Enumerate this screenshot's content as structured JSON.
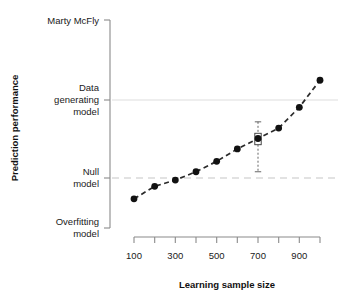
{
  "chart_data": {
    "type": "line",
    "title": "",
    "xlabel": "Learning sample size",
    "ylabel": "Prediction performance",
    "x": [
      100,
      200,
      300,
      400,
      500,
      600,
      700,
      800,
      900,
      1000
    ],
    "values": [
      0.14,
      0.2,
      0.23,
      0.27,
      0.32,
      0.38,
      0.43,
      0.48,
      0.58,
      0.71
    ],
    "xlim": [
      100,
      1000
    ],
    "ylim": [
      0,
      1
    ],
    "xticks": [
      100,
      200,
      300,
      400,
      500,
      600,
      700,
      800,
      900,
      1000
    ],
    "xticklabels": [
      "100",
      "",
      "300",
      "",
      "500",
      "",
      "700",
      "",
      "900",
      ""
    ],
    "yticks": [
      1.0,
      0.615,
      0.24,
      0.0
    ],
    "yticklabels": [
      "Marty McFly",
      "Data\ngenerating\nmodel",
      "Null\nmodel",
      "Overfitting\nmodel"
    ],
    "grid": false,
    "legend": null,
    "reference_lines": [
      {
        "name": "data-generating-model-line",
        "y": 0.615,
        "style": "solid",
        "color": "#e8e8e8"
      },
      {
        "name": "null-model-line",
        "y": 0.24,
        "style": "dashed",
        "color": "#d9d9d9"
      }
    ],
    "annotations": [
      {
        "name": "boxplot-at-700",
        "x": 700,
        "whisker_low": 0.27,
        "q1": 0.4,
        "median": 0.425,
        "q3": 0.455,
        "whisker_high": 0.51
      }
    ],
    "series_style": {
      "line": "dashed",
      "color": "#2b2b2b",
      "marker": "filled-circle"
    }
  },
  "axis": {
    "y_tick_labels": [
      {
        "id": "marty",
        "lines": [
          "Marty McFly"
        ]
      },
      {
        "id": "dgm",
        "lines": [
          "Data",
          "generating",
          "model"
        ]
      },
      {
        "id": "null",
        "lines": [
          "Null",
          "model"
        ]
      },
      {
        "id": "overfit",
        "lines": [
          "Overfitting",
          "model"
        ]
      }
    ],
    "x_tick_labels": [
      "100",
      "300",
      "500",
      "700",
      "900"
    ],
    "x_title": "Learning sample size",
    "y_title": "Prediction performance"
  },
  "colors": {
    "ink": "#1a1a1a",
    "axis": "#808080",
    "series": "#2b2b2b",
    "ref_solid": "#e8e8e8",
    "ref_dashed": "#d9d9d9",
    "background": "#ffffff"
  }
}
